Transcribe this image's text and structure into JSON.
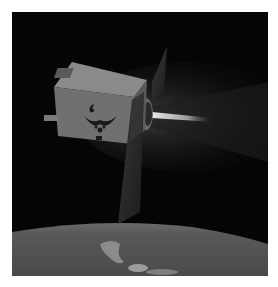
{
  "image": {
    "alt": "Illustration of a satellite in orbit above Earth with an engine plume",
    "subject": "satellite",
    "emblem": "air-force-wings-emblem",
    "colors": {
      "space": "#050505",
      "earth": "#5a5a5a",
      "earth_highlight": "#a8a8a8",
      "satellite_body": "#7a7a7a",
      "solar_panel": "#2a2a2a",
      "plume": "#d8d8d8",
      "border": "#ffffff"
    }
  }
}
